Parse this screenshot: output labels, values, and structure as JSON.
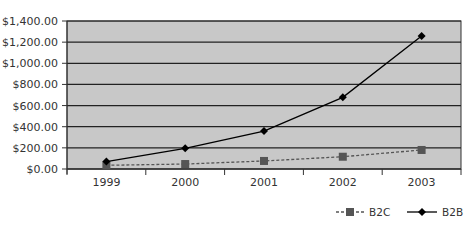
{
  "chart_data": {
    "type": "line",
    "title": "",
    "xlabel": "",
    "ylabel": "",
    "categories": [
      "1999",
      "2000",
      "2001",
      "2002",
      "2003"
    ],
    "series": [
      {
        "name": "B2C",
        "values": [
          35,
          47,
          76,
          116,
          180
        ],
        "marker": "square",
        "line": "dashed",
        "color": "#555555"
      },
      {
        "name": "B2B",
        "values": [
          70,
          196,
          359,
          678,
          1258
        ],
        "marker": "diamond",
        "line": "solid",
        "color": "#000000"
      }
    ],
    "ylim": [
      0,
      1400
    ],
    "yticks": [
      0,
      200,
      400,
      600,
      800,
      1000,
      1200,
      1400
    ],
    "ytick_labels": [
      "$0.00",
      "$200.00",
      "$400.00",
      "$600.00",
      "$800.00",
      "$1,000.00",
      "$1,200.00",
      "$1,400.00"
    ],
    "grid": true,
    "legend_position": "bottom-right",
    "colors": {
      "plot_background": "#c8c8c8",
      "gridline": "#222222"
    }
  },
  "legend": {
    "b2c_label": "B2C",
    "b2b_label": "B2B"
  }
}
